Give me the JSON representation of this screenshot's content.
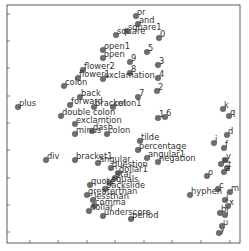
{
  "chart_data": {
    "type": "scatter",
    "title": "",
    "xlabel": "",
    "ylabel": "",
    "grid": false,
    "legend": null,
    "tick_labels_visible": false,
    "frame_px": {
      "left": 7,
      "top": 5,
      "right": 240,
      "bottom": 243
    },
    "xticks_px": [
      30,
      58,
      87,
      115,
      144,
      172,
      201,
      230
    ],
    "yticks_px": [
      14,
      41,
      68,
      96,
      123,
      150,
      178,
      205,
      232
    ],
    "marker_color": "#6e6e6e",
    "points": [
      {
        "label": "or",
        "x": 136,
        "y": 16
      },
      {
        "label": "and",
        "x": 138,
        "y": 24
      },
      {
        "label": "square1",
        "x": 127,
        "y": 31
      },
      {
        "label": "square",
        "x": 116,
        "y": 35
      },
      {
        "label": "0",
        "x": 159,
        "y": 38
      },
      {
        "label": "open1",
        "x": 103,
        "y": 50
      },
      {
        "label": "5",
        "x": 147,
        "y": 52
      },
      {
        "label": "open",
        "x": 103,
        "y": 58
      },
      {
        "label": "9",
        "x": 130,
        "y": 62
      },
      {
        "label": "3",
        "x": 158,
        "y": 65
      },
      {
        "label": "flower2",
        "x": 83,
        "y": 70
      },
      {
        "label": "flower1",
        "x": 78,
        "y": 78
      },
      {
        "label": "exclamation",
        "x": 103,
        "y": 79
      },
      {
        "label": "8",
        "x": 130,
        "y": 73
      },
      {
        "label": "4",
        "x": 158,
        "y": 78
      },
      {
        "label": "colon",
        "x": 64,
        "y": 86
      },
      {
        "label": "2",
        "x": 157,
        "y": 91
      },
      {
        "label": "back",
        "x": 80,
        "y": 97
      },
      {
        "label": "7",
        "x": 138,
        "y": 97
      },
      {
        "label": "plus",
        "x": 18,
        "y": 107
      },
      {
        "label": "forward",
        "x": 70,
        "y": 105
      },
      {
        "label": "bracket",
        "x": 94,
        "y": 107
      },
      {
        "label": "colon1",
        "x": 113,
        "y": 107
      },
      {
        "label": "double colon",
        "x": 61,
        "y": 116
      },
      {
        "label": "exclamtion",
        "x": 75,
        "y": 124
      },
      {
        "label": "1",
        "x": 158,
        "y": 118
      },
      {
        "label": "6",
        "x": 165,
        "y": 117
      },
      {
        "label": "k",
        "x": 223,
        "y": 109
      },
      {
        "label": "q",
        "x": 229,
        "y": 116
      },
      {
        "label": "dash",
        "x": 92,
        "y": 131
      },
      {
        "label": "minus",
        "x": 75,
        "y": 134
      },
      {
        "label": "colon",
        "x": 107,
        "y": 134
      },
      {
        "label": "d",
        "x": 227,
        "y": 135
      },
      {
        "label": "i",
        "x": 214,
        "y": 143
      },
      {
        "label": "tilde",
        "x": 140,
        "y": 141
      },
      {
        "label": "percentage",
        "x": 138,
        "y": 150
      },
      {
        "label": "f",
        "x": 224,
        "y": 148
      },
      {
        "label": "div",
        "x": 46,
        "y": 160
      },
      {
        "label": "bracket1",
        "x": 75,
        "y": 160
      },
      {
        "label": "angular1",
        "x": 147,
        "y": 158
      },
      {
        "label": "negation",
        "x": 158,
        "y": 162
      },
      {
        "label": "angular",
        "x": 98,
        "y": 163
      },
      {
        "label": "question",
        "x": 111,
        "y": 168
      },
      {
        "label": "v",
        "x": 225,
        "y": 160
      },
      {
        "label": "w",
        "x": 221,
        "y": 164
      },
      {
        "label": "dollar1",
        "x": 118,
        "y": 173
      },
      {
        "label": "star",
        "x": 115,
        "y": 178
      },
      {
        "label": "o",
        "x": 207,
        "y": 176
      },
      {
        "label": "a",
        "x": 224,
        "y": 172
      },
      {
        "label": "t",
        "x": 227,
        "y": 168
      },
      {
        "label": "equals",
        "x": 110,
        "y": 183
      },
      {
        "label": "quote",
        "x": 90,
        "y": 185
      },
      {
        "label": "backslide",
        "x": 105,
        "y": 189
      },
      {
        "label": "c",
        "x": 218,
        "y": 189
      },
      {
        "label": "greaterthan",
        "x": 87,
        "y": 195
      },
      {
        "label": "hyphen",
        "x": 190,
        "y": 195
      },
      {
        "label": "m",
        "x": 230,
        "y": 192
      },
      {
        "label": "lessthan",
        "x": 93,
        "y": 200
      },
      {
        "label": "j",
        "x": 225,
        "y": 200
      },
      {
        "label": "comma",
        "x": 94,
        "y": 206
      },
      {
        "label": "x",
        "x": 228,
        "y": 206
      },
      {
        "label": "dollar",
        "x": 89,
        "y": 211
      },
      {
        "label": "underscore",
        "x": 103,
        "y": 216
      },
      {
        "label": "b",
        "x": 220,
        "y": 213
      },
      {
        "label": "l",
        "x": 225,
        "y": 215
      },
      {
        "label": "period",
        "x": 131,
        "y": 219
      },
      {
        "label": "u",
        "x": 222,
        "y": 226
      },
      {
        "label": "y",
        "x": 219,
        "y": 233
      }
    ]
  }
}
